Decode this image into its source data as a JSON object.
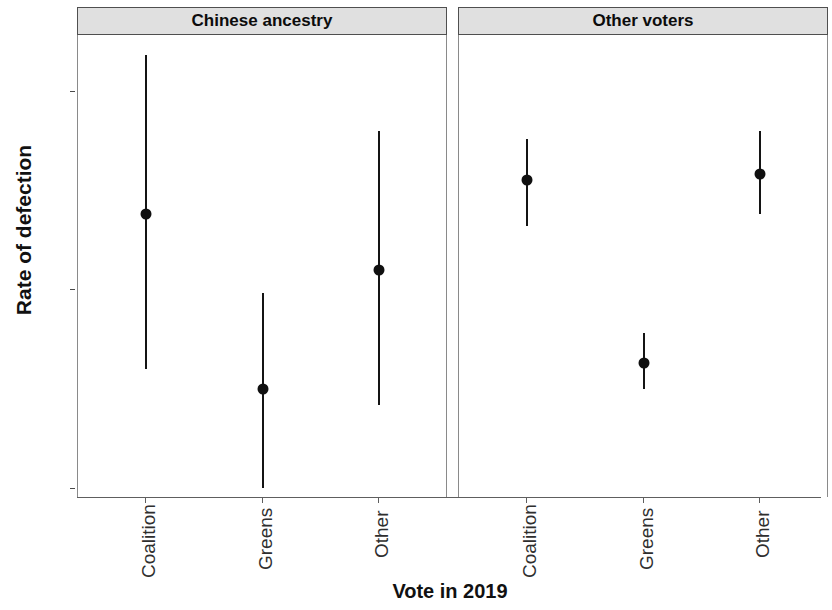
{
  "chart_data": {
    "type": "scatter",
    "title": "",
    "xlabel": "Vote in 2019",
    "ylabel": "Rate of defection",
    "ylim": [
      -0.3,
      11.6
    ],
    "y_ticks": [
      "0%",
      "5%",
      "10%"
    ],
    "y_tick_values": [
      0,
      5,
      10
    ],
    "grid": false,
    "legend": null,
    "categories": [
      "Coalition",
      "Greens",
      "Other"
    ],
    "facets": [
      {
        "label": "Chinese ancestry",
        "points": [
          {
            "category": "Coalition",
            "value": 6.9,
            "low": 3.0,
            "high": 10.9
          },
          {
            "category": "Greens",
            "value": 2.5,
            "low": 0.0,
            "high": 4.9
          },
          {
            "category": "Other",
            "value": 5.5,
            "low": 2.1,
            "high": 9.0
          }
        ]
      },
      {
        "label": "Other voters",
        "points": [
          {
            "category": "Coalition",
            "value": 7.75,
            "low": 6.6,
            "high": 8.8
          },
          {
            "category": "Greens",
            "value": 3.15,
            "low": 2.5,
            "high": 3.9
          },
          {
            "category": "Other",
            "value": 7.9,
            "low": 6.9,
            "high": 9.0
          }
        ]
      }
    ]
  },
  "axis": {
    "y_title": "Rate of defection",
    "x_title": "Vote in 2019",
    "y_tick_0": "0%",
    "y_tick_5": "5%",
    "y_tick_10": "10%"
  },
  "facet_labels": {
    "left": "Chinese ancestry",
    "right": "Other voters"
  },
  "x_tick_labels": {
    "coalition": "Coalition",
    "greens": "Greens",
    "other": "Other"
  },
  "colors": {
    "point": "#101010",
    "errorbar": "#141414",
    "strip_bg": "#e0e0e0",
    "strip_border": "#4f4f4f",
    "panel_border": "#8a8a8a",
    "axis": "#5e5e5e",
    "text": "#111111"
  }
}
